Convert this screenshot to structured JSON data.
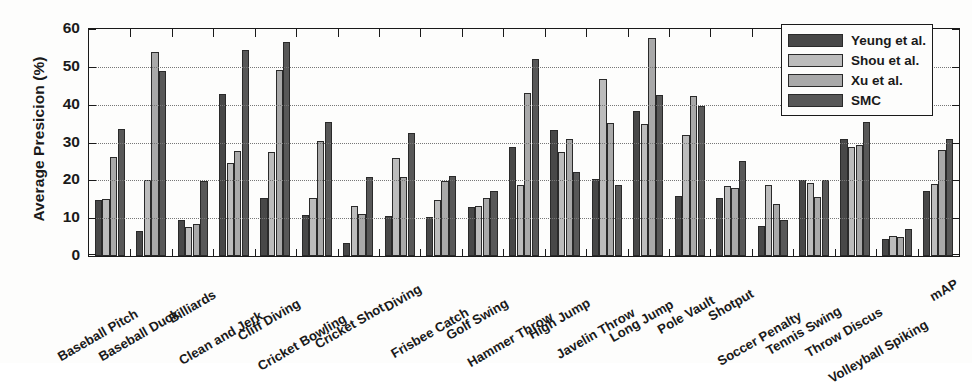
{
  "chart_data": {
    "type": "bar",
    "title": "",
    "xlabel": "",
    "ylabel": "Average Presicion (%)",
    "ylim": [
      0,
      60
    ],
    "ytick_labels": [
      "0",
      "10",
      "20",
      "30",
      "40",
      "50",
      "60"
    ],
    "yticks": [
      0,
      10,
      20,
      30,
      40,
      50,
      60
    ],
    "grid": "horizontal-dotted",
    "legend_position": "top-right",
    "categories": [
      "Baseball Pitch",
      "Baseball Duck",
      "Billiards",
      "Clean and Jerk",
      "Cliff Diving",
      "Cricket Bowling",
      "Cricket Shot",
      "Diving",
      "Frisbee Catch",
      "Golf Swing",
      "Hammer Throw",
      "High Jump",
      "Javelin Throw",
      "Long Jump",
      "Pole Vault",
      "Shotput",
      "Soccer Penalty",
      "Tennis Swing",
      "Throw Discus",
      "Volleyball Spiking",
      "mAP"
    ],
    "series": [
      {
        "name": "Yeung et al.",
        "color": "#484848",
        "values": [
          14.8,
          6.6,
          9.4,
          42.7,
          15.4,
          10.8,
          3.5,
          10.5,
          10.3,
          13.0,
          28.8,
          33.3,
          20.4,
          38.3,
          15.9,
          15.4,
          7.9,
          20.1,
          30.8,
          4.6,
          17.2
        ]
      },
      {
        "name": "Shou et al.",
        "color": "#bcbcbc",
        "values": [
          15.0,
          20.0,
          7.8,
          24.5,
          27.4,
          15.4,
          13.3,
          26.0,
          14.9,
          13.2,
          18.7,
          27.5,
          46.7,
          34.8,
          32.0,
          18.5,
          18.8,
          19.2,
          28.8,
          5.2,
          19.0
        ]
      },
      {
        "name": "Xu et al.",
        "color": "#a9a9a9",
        "values": [
          26.2,
          53.8,
          8.5,
          27.8,
          49.2,
          30.5,
          11.0,
          20.8,
          19.8,
          15.3,
          43.0,
          30.8,
          35.1,
          57.6,
          42.3,
          18.0,
          13.8,
          15.5,
          29.3,
          5.0,
          28.0
        ]
      },
      {
        "name": "SMC",
        "color": "#585858",
        "values": [
          33.7,
          48.8,
          19.9,
          54.5,
          56.7,
          35.5,
          20.8,
          32.4,
          21.1,
          17.1,
          52.1,
          22.3,
          18.8,
          42.5,
          39.6,
          25.0,
          9.6,
          20.2,
          35.3,
          7.2,
          31.0
        ]
      }
    ]
  },
  "legend": {
    "entries": [
      {
        "label": "Yeung et al."
      },
      {
        "label": "Shou et al."
      },
      {
        "label": "Xu et al."
      },
      {
        "label": "SMC"
      }
    ]
  }
}
